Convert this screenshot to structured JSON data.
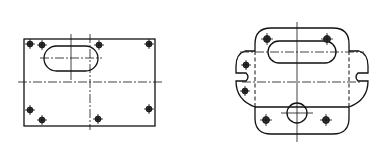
{
  "figure": {
    "views": [
      {
        "name": "left-view",
        "shape": "rectangle",
        "hole_count": 8,
        "features": [
          "obround-slot",
          "center-lines"
        ]
      },
      {
        "name": "right-view",
        "shape": "rounded-profile",
        "hole_count": 6,
        "features": [
          "obround-slot",
          "circular-boss",
          "side-notches",
          "hidden-lines",
          "center-lines"
        ]
      }
    ],
    "colors": {
      "line": "#111111",
      "background": "#ffffff"
    }
  }
}
